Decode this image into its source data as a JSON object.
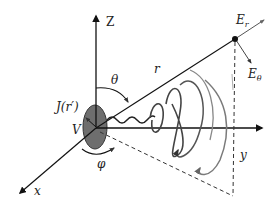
{
  "diagram": {
    "axes": {
      "z_label": "Z",
      "y_label": "y",
      "x_label": "x"
    },
    "labels": {
      "theta": "θ",
      "phi": "φ",
      "r": "r",
      "source_current": "J(r′)",
      "volume": "V",
      "E_r_main": "E",
      "E_r_sub": "r",
      "E_theta_main": "E",
      "E_theta_sub": "θ"
    },
    "colors": {
      "line": "#222222",
      "source_fill": "#6e6e6e",
      "loops": "#555555",
      "loops_light": "#8a8a8a"
    }
  }
}
